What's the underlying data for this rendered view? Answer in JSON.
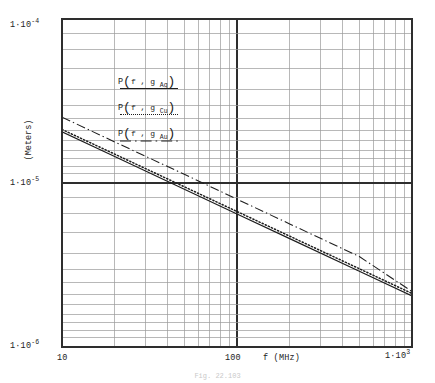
{
  "figure": {
    "caption": "Fig. 22.103"
  },
  "axes": {
    "y_title": "(Meters)",
    "x_title": "f (MHz)",
    "y_ticks": [
      {
        "mantissa": "1·10",
        "exp": "-4"
      },
      {
        "mantissa": "1·10",
        "exp": "-5"
      },
      {
        "mantissa": "1·10",
        "exp": "-6"
      }
    ],
    "x_ticks": [
      {
        "text": "10",
        "exp": ""
      },
      {
        "text": "100",
        "exp": ""
      },
      {
        "text": "1·10",
        "exp": "3"
      }
    ]
  },
  "legend": {
    "entries": [
      {
        "fn": "P",
        "args": "f , g",
        "sub": "Ag",
        "style": "solid",
        "label": "P(f, g Ag)"
      },
      {
        "fn": "P",
        "args": "f , g",
        "sub": "Cu",
        "style": "dotted",
        "label": "P(f, g Cu)"
      },
      {
        "fn": "P",
        "args": "f , g",
        "sub": "Au",
        "style": "dashdot",
        "label": "P(f, g Au)"
      }
    ]
  },
  "chart_data": {
    "type": "line",
    "title": "",
    "xlabel": "f (MHz)",
    "ylabel": "(Meters)",
    "xscale": "log",
    "yscale": "log",
    "xlim": [
      10,
      1000
    ],
    "ylim": [
      1e-06,
      0.0001
    ],
    "grid": true,
    "grid_minor": true,
    "legend_position": "upper-left-inside",
    "x": [
      10,
      20,
      50,
      100,
      200,
      500,
      1000
    ],
    "series": [
      {
        "name": "P(f, g Ag)",
        "style": "solid",
        "color": "#1d1d1d",
        "values": [
          2.05e-05,
          1.45e-05,
          9.17e-06,
          6.48e-06,
          4.58e-06,
          2.9e-06,
          2.05e-06
        ]
      },
      {
        "name": "P(f, g Cu)",
        "style": "dotted",
        "color": "#1d1d1d",
        "values": [
          2.12e-05,
          1.5e-05,
          9.48e-06,
          6.7e-06,
          4.74e-06,
          3e-06,
          2.12e-06
        ]
      },
      {
        "name": "P(f, g Au)",
        "style": "dashdot",
        "color": "#1d1d1d",
        "values": [
          2.52e-05,
          1.78e-05,
          1.13e-05,
          7.97e-06,
          5.63e-06,
          3.56e-06,
          2.18e-06
        ]
      }
    ]
  }
}
